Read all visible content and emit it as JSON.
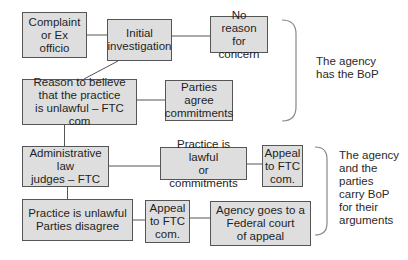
{
  "diagram": {
    "nodes": {
      "complaint": {
        "label": "Complaint\nor Ex officio"
      },
      "initial_investigation": {
        "label": "Initial\ninvestigation"
      },
      "no_reason": {
        "label": "No reason\nfor concern"
      },
      "reason_to_believe": {
        "label": "Reason to believe\nthat the practice\nis unlawful – FTC com"
      },
      "parties_agree": {
        "label": "Parties agree\ncommitments"
      },
      "admin_law_judges": {
        "label": "Administrative law\njudges – FTC"
      },
      "practice_lawful": {
        "label": "Practice is lawful\nor commitments"
      },
      "appeal_top": {
        "label": "Appeal\nto FTC\ncom."
      },
      "practice_unlawful": {
        "label": "Practice is unlawful\nParties disagree"
      },
      "appeal_bottom": {
        "label": "Appeal\nto FTC\ncom."
      },
      "federal_court": {
        "label": "Agency goes to a\nFederal court\nof appeal"
      }
    },
    "edges": [
      [
        "complaint",
        "initial_investigation"
      ],
      [
        "initial_investigation",
        "no_reason"
      ],
      [
        "initial_investigation",
        "reason_to_believe"
      ],
      [
        "reason_to_believe",
        "parties_agree"
      ],
      [
        "reason_to_believe",
        "admin_law_judges"
      ],
      [
        "admin_law_judges",
        "practice_lawful"
      ],
      [
        "practice_lawful",
        "appeal_top"
      ],
      [
        "admin_law_judges",
        "practice_unlawful"
      ],
      [
        "practice_unlawful",
        "appeal_bottom"
      ],
      [
        "appeal_bottom",
        "federal_court"
      ]
    ],
    "annotations": {
      "top_brace": "The agency\nhas the BoP",
      "bottom_brace": "The agency\nand the\nparties\ncarry BoP\nfor their\narguments"
    },
    "colors": {
      "box_fill": "#dedede",
      "box_border": "#555555",
      "line": "#555555",
      "brace": "#888888"
    }
  }
}
